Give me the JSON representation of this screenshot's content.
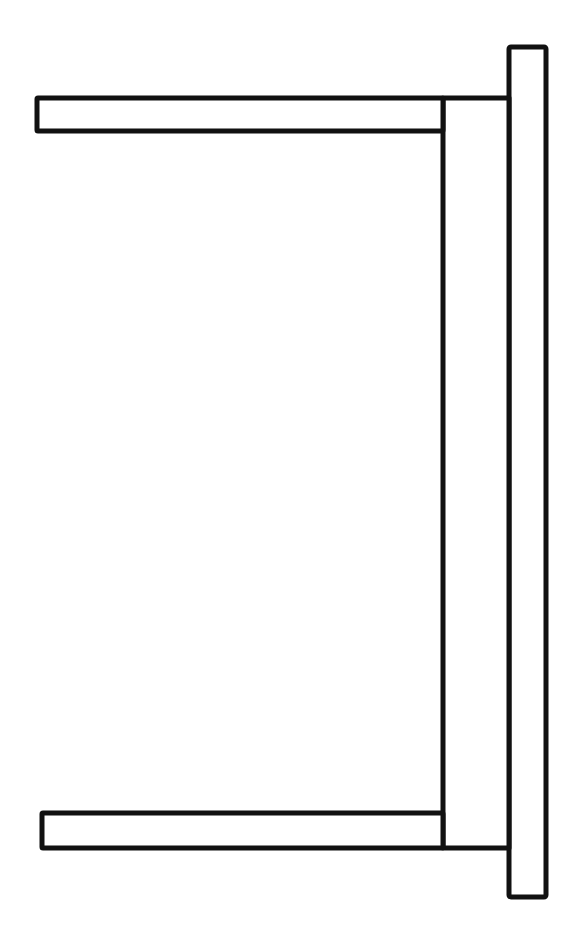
{
  "drawing": {
    "subject": "table side view line drawing",
    "stroke_color": "#111111",
    "background_color": "#ffffff",
    "parts": {
      "tabletop": {
        "x": 507,
        "y": 46,
        "w": 40,
        "h": 852
      },
      "apron": {
        "x": 443,
        "y": 97,
        "w": 66,
        "h": 751
      },
      "leg_top": {
        "x": 36,
        "y": 97,
        "w": 407,
        "h": 35
      },
      "leg_bottom": {
        "x": 41,
        "y": 812,
        "w": 402,
        "h": 36
      }
    }
  }
}
